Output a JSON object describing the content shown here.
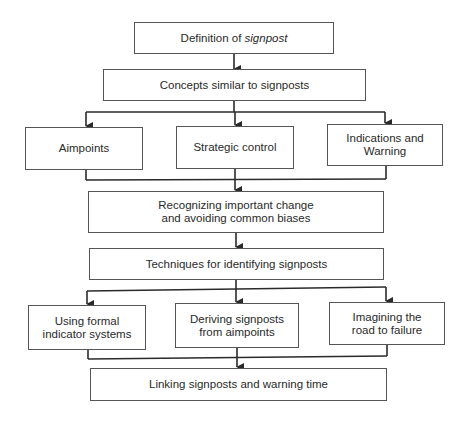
{
  "diagram": {
    "nodes": {
      "definition": {
        "text": "Definition of ",
        "text_italic": "signpost"
      },
      "concepts": {
        "text": "Concepts similar to signposts"
      },
      "aimpoints": {
        "text": "Aimpoints"
      },
      "strategic_control": {
        "text": "Strategic control"
      },
      "indications_warning": {
        "text": "Indications and Warning"
      },
      "recognizing_change": {
        "text": "Recognizing important change and avoiding common biases"
      },
      "techniques": {
        "text": "Techniques for identifying signposts"
      },
      "formal_indicators": {
        "text": "Using formal indicator systems"
      },
      "deriving_signposts": {
        "text": "Deriving signposts from aimpoints"
      },
      "imagining_failure": {
        "text": "Imagining the road to failure"
      },
      "linking_warning": {
        "text": "Linking signposts and warning time"
      }
    },
    "edges": [
      [
        "definition",
        "concepts"
      ],
      [
        "concepts",
        "aimpoints"
      ],
      [
        "concepts",
        "strategic_control"
      ],
      [
        "concepts",
        "indications_warning"
      ],
      [
        "aimpoints",
        "recognizing_change"
      ],
      [
        "strategic_control",
        "recognizing_change"
      ],
      [
        "indications_warning",
        "recognizing_change"
      ],
      [
        "recognizing_change",
        "techniques"
      ],
      [
        "techniques",
        "formal_indicators"
      ],
      [
        "techniques",
        "deriving_signposts"
      ],
      [
        "techniques",
        "imagining_failure"
      ],
      [
        "formal_indicators",
        "linking_warning"
      ],
      [
        "deriving_signposts",
        "linking_warning"
      ],
      [
        "imagining_failure",
        "linking_warning"
      ]
    ],
    "colors": {
      "line": "#2a2a2a",
      "border": "#555555",
      "text": "#2a2a2a"
    }
  }
}
